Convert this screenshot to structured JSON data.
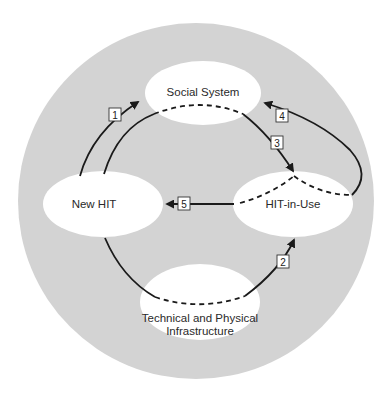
{
  "diagram": {
    "background_color": "#d3d3d3",
    "node_color": "#ffffff",
    "line_color": "#1a1a1a",
    "nodes": [
      {
        "id": "social",
        "label": "Social System"
      },
      {
        "id": "newhit",
        "label": "New HIT"
      },
      {
        "id": "hitinuse",
        "label": "HIT-in-Use"
      },
      {
        "id": "tech_line1",
        "label": "Technical and Physical"
      },
      {
        "id": "tech_line2",
        "label": "Infrastructure"
      }
    ],
    "arrows": [
      {
        "number": "1",
        "from": "New HIT",
        "to": "Social System"
      },
      {
        "number": "2",
        "from": "Technical and Physical Infrastructure",
        "to": "HIT-in-Use"
      },
      {
        "number": "3",
        "from": "Social System",
        "to": "HIT-in-Use"
      },
      {
        "number": "4",
        "from": "HIT-in-Use",
        "to": "Social System"
      },
      {
        "number": "5",
        "from": "HIT-in-Use",
        "to": "New HIT"
      }
    ]
  }
}
